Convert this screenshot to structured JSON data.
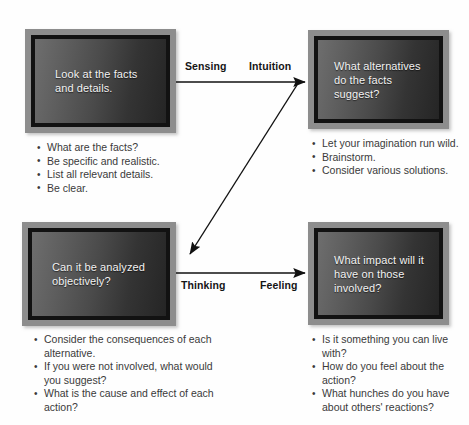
{
  "diagram": {
    "colors": {
      "box_frame": "#8d8d8d",
      "box_border": "#121212",
      "box_fill_light": "#6e6e6e",
      "box_fill_dark": "#252525",
      "box_text": "#f2f2f2",
      "bullet_text": "#3a3a3a",
      "arrow": "#111111",
      "background": "#ffffff"
    },
    "boxes": {
      "top_left": {
        "text": "Look at the facts and details.",
        "bullets": [
          "What are the facts?",
          "Be specific and realistic.",
          "List all relevant details.",
          "Be clear."
        ]
      },
      "top_right": {
        "text": "What alternatives do the facts suggest?",
        "bullets": [
          "Let your imagination run wild.",
          "Brainstorm.",
          "Consider various solutions."
        ]
      },
      "bottom_left": {
        "text": "Can it be analyzed objectively?",
        "bullets": [
          "Consider the consequences of each alternative.",
          "If you were not involved, what would you suggest?",
          "What is the cause and effect of each action?"
        ]
      },
      "bottom_right": {
        "text": "What impact will it have on those involved?",
        "bullets": [
          "Is it something you can live with?",
          "How do you feel about the action?",
          "What hunches do you have about others' reactions?"
        ]
      }
    },
    "arrow_labels": {
      "sensing": "Sensing",
      "intuition": "Intuition",
      "thinking": "Thinking",
      "feeling": "Feeling"
    },
    "arrows": [
      {
        "name": "top-horizontal-arrow",
        "from": "top-left-box",
        "to": "top-right-box",
        "direction": "right"
      },
      {
        "name": "diagonal-arrow",
        "from": "top-right-box",
        "to": "bottom-left-box",
        "direction": "down-left"
      },
      {
        "name": "bottom-horizontal-arrow",
        "from": "bottom-left-box",
        "to": "bottom-right-box",
        "direction": "right"
      }
    ]
  }
}
